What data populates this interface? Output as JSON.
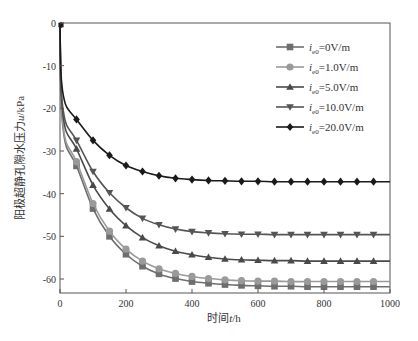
{
  "chart_data": {
    "type": "line",
    "title": "",
    "xlabel": "时间t/h",
    "ylabel": "阳极超静孔隙水压力u/kPa",
    "xlim": [
      0,
      1000
    ],
    "ylim": [
      -64,
      0
    ],
    "xticks": [
      0,
      200,
      400,
      600,
      800,
      1000
    ],
    "yticks": [
      0,
      -10,
      -20,
      -30,
      -40,
      -50,
      -60
    ],
    "grid": false,
    "legend_position": "upper right",
    "x": [
      0,
      50,
      100,
      150,
      200,
      250,
      300,
      350,
      400,
      450,
      500,
      550,
      600,
      650,
      700,
      750,
      800,
      850,
      900,
      950,
      1000
    ],
    "series": [
      {
        "name": "ie0=0V/m",
        "marker": "square",
        "color": "#6e6e6e",
        "values": [
          0,
          -33.5,
          -43.5,
          -50.0,
          -54.2,
          -57.0,
          -58.8,
          -59.9,
          -60.6,
          -61.0,
          -61.3,
          -61.5,
          -61.6,
          -61.7,
          -61.7,
          -61.8,
          -61.8,
          -61.8,
          -61.8,
          -61.8,
          -61.8
        ]
      },
      {
        "name": "ie0=1.0V/m",
        "marker": "circle",
        "color": "#9a9a9a",
        "values": [
          0,
          -32.5,
          -42.3,
          -48.8,
          -53.0,
          -55.8,
          -57.6,
          -58.7,
          -59.4,
          -59.9,
          -60.2,
          -60.4,
          -60.5,
          -60.5,
          -60.6,
          -60.6,
          -60.6,
          -60.6,
          -60.6,
          -60.6,
          -60.6
        ]
      },
      {
        "name": "ie0=5.0V/m",
        "marker": "triangle-up",
        "color": "#4a4a4a",
        "values": [
          0,
          -29.5,
          -38.0,
          -43.6,
          -47.5,
          -50.3,
          -52.2,
          -53.5,
          -54.3,
          -54.9,
          -55.3,
          -55.5,
          -55.6,
          -55.7,
          -55.7,
          -55.8,
          -55.8,
          -55.8,
          -55.8,
          -55.8,
          -55.8
        ]
      },
      {
        "name": "ie0=10.0V/m",
        "marker": "triangle-down",
        "color": "#555555",
        "values": [
          0,
          -27.5,
          -34.8,
          -39.8,
          -43.3,
          -45.8,
          -47.3,
          -48.3,
          -48.9,
          -49.2,
          -49.4,
          -49.5,
          -49.5,
          -49.6,
          -49.6,
          -49.6,
          -49.6,
          -49.6,
          -49.6,
          -49.6,
          -49.6
        ]
      },
      {
        "name": "ie0=20.0V/m",
        "marker": "diamond",
        "color": "#1a1a1a",
        "values": [
          0,
          -22.6,
          -27.5,
          -31.0,
          -33.4,
          -34.8,
          -35.8,
          -36.4,
          -36.7,
          -36.9,
          -37.0,
          -37.1,
          -37.1,
          -37.2,
          -37.2,
          -37.2,
          -37.2,
          -37.2,
          -37.2,
          -37.2,
          -37.2
        ]
      }
    ]
  },
  "legend": {
    "items": [
      {
        "prefix": "i",
        "sub": "e0",
        "suffix": "=0V/m"
      },
      {
        "prefix": "i",
        "sub": "e0",
        "suffix": "=1.0V/m"
      },
      {
        "prefix": "i",
        "sub": "e0",
        "suffix": "=5.0V/m"
      },
      {
        "prefix": "i",
        "sub": "e0",
        "suffix": "=10.0V/m"
      },
      {
        "prefix": "i",
        "sub": "e0",
        "suffix": "=20.0V/m"
      }
    ]
  },
  "axes": {
    "xlabel_pre": "时间",
    "xlabel_var": "t",
    "xlabel_post": "/h",
    "ylabel_pre": "阳极超静孔隙水压力",
    "ylabel_var": "u",
    "ylabel_post": "/kPa"
  }
}
